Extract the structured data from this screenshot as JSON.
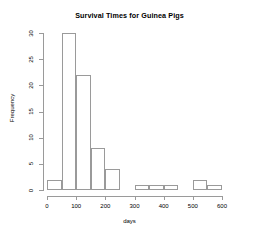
{
  "chart_data": {
    "type": "bar",
    "title": "Survival Times for Guinea Pigs",
    "xlabel": "days",
    "ylabel": "Frequency",
    "bin_width": 50,
    "bin_edges": [
      0,
      50,
      100,
      150,
      200,
      250,
      300,
      350,
      400,
      450,
      500,
      550,
      600
    ],
    "categories": [
      "0-50",
      "50-100",
      "100-150",
      "150-200",
      "200-250",
      "250-300",
      "300-350",
      "350-400",
      "400-450",
      "450-500",
      "500-550",
      "550-600"
    ],
    "values": [
      2,
      30,
      22,
      8,
      4,
      0,
      1,
      1,
      1,
      0,
      2,
      1
    ],
    "xlim": [
      0,
      600
    ],
    "ylim": [
      0,
      30
    ],
    "xticks": [
      0,
      100,
      200,
      300,
      400,
      500,
      600
    ],
    "yticks": [
      0,
      5,
      10,
      15,
      20,
      25,
      30
    ],
    "xtick_labels": [
      "0",
      "100",
      "200",
      "300",
      "400",
      "500",
      "600"
    ],
    "ytick_labels": [
      "0",
      "5",
      "10",
      "15",
      "20",
      "25",
      "30"
    ],
    "grid": false,
    "legend": null,
    "bar_fill_color": "#ffffff",
    "bar_border_color": "#9a9a9a",
    "axis_color": "#9a9a9a",
    "text_color": "#000000",
    "background_color": "#ffffff"
  }
}
